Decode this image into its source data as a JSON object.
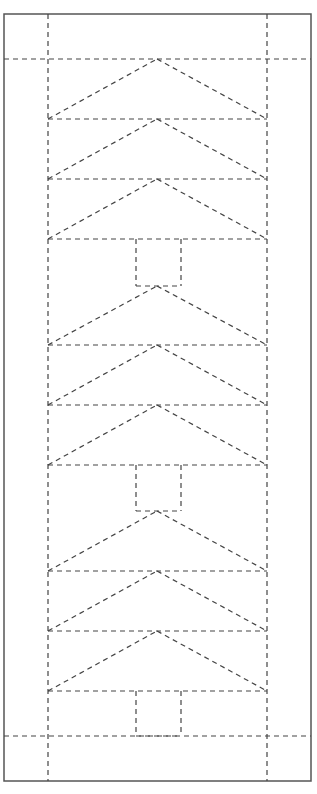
{
  "diagram": {
    "title": "",
    "type": "quilt-pattern-tree-table-runner",
    "width": 317,
    "height": 794,
    "colors": {
      "background": "#ffffff",
      "border": "#555555",
      "dash": "#444444"
    },
    "border_rect": {
      "x": 4,
      "y": 14,
      "w": 307,
      "h": 767
    },
    "guides": {
      "vertical_x": [
        48,
        267
      ],
      "vertical_y_range": [
        14,
        781
      ],
      "horizontal_y": [
        59,
        736
      ],
      "horizontal_x_range": [
        4,
        311
      ]
    },
    "panel": {
      "x_left": 48,
      "x_right": 267,
      "apex_x": 157
    },
    "trees": [
      {
        "name": "tree-1",
        "tiers": [
          {
            "apex_y": 59,
            "base_y": 119
          },
          {
            "apex_y": 119,
            "base_y": 179
          },
          {
            "apex_y": 179,
            "base_y": 239
          }
        ],
        "trunk": {
          "x": 136,
          "y": 239,
          "w": 45,
          "h": 47
        }
      },
      {
        "name": "tree-2",
        "tiers": [
          {
            "apex_y": 286,
            "base_y": 345
          },
          {
            "apex_y": 345,
            "base_y": 405
          },
          {
            "apex_y": 405,
            "base_y": 465
          }
        ],
        "trunk": {
          "x": 136,
          "y": 465,
          "w": 45,
          "h": 46
        }
      },
      {
        "name": "tree-3",
        "tiers": [
          {
            "apex_y": 511,
            "base_y": 571
          },
          {
            "apex_y": 571,
            "base_y": 631
          },
          {
            "apex_y": 631,
            "base_y": 691
          }
        ],
        "trunk": {
          "x": 136,
          "y": 691,
          "w": 45,
          "h": 45
        }
      }
    ]
  }
}
